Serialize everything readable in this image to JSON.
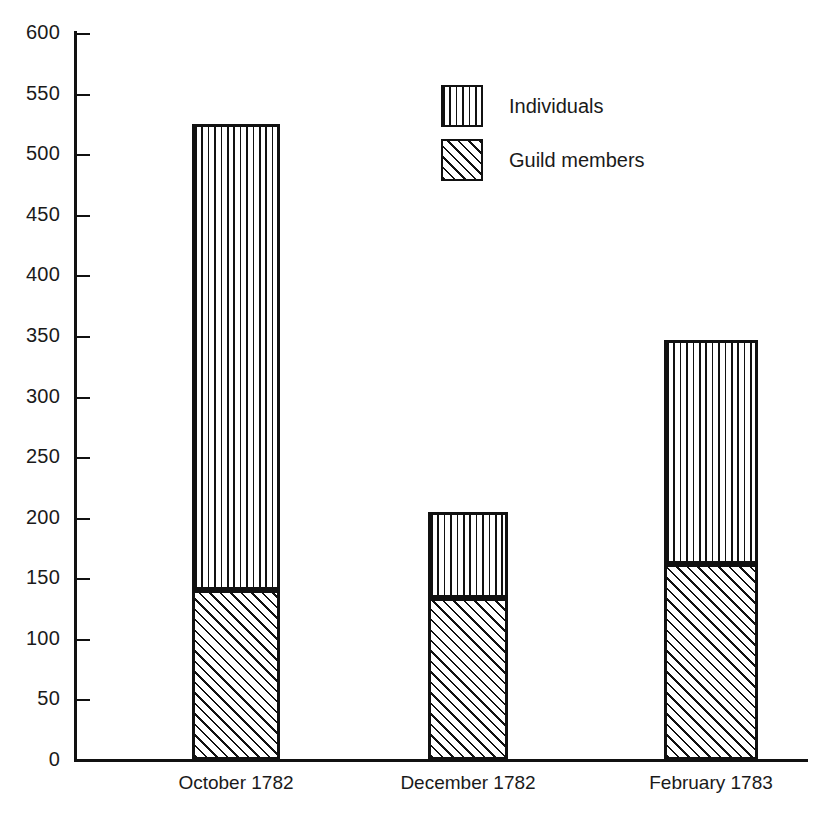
{
  "chart_data": {
    "type": "bar",
    "subtype": "stacked",
    "title": "",
    "subtitle": "",
    "xlabel": "",
    "ylabel": "",
    "categories": [
      "October 1782",
      "December 1782",
      "February 1783"
    ],
    "series": [
      {
        "name": "Guild members",
        "pattern": "diagonal-hatch",
        "values": [
          140,
          134,
          162
        ]
      },
      {
        "name": "Individuals",
        "pattern": "vertical-lines",
        "values": [
          385,
          71,
          185
        ]
      }
    ],
    "stack_totals": [
      525,
      205,
      347
    ],
    "ylim": [
      0,
      600
    ],
    "ytick_step": 50,
    "yticks": [
      0,
      50,
      100,
      150,
      200,
      250,
      300,
      350,
      400,
      450,
      500,
      550,
      600
    ],
    "ytick_labels": [
      "0",
      "50",
      "100",
      "150",
      "200",
      "250",
      "300",
      "350",
      "400",
      "450",
      "500",
      "550",
      "600"
    ],
    "grid": false,
    "legend_position": "upper-center",
    "legend_entries": [
      "Individuals",
      "Guild members"
    ],
    "colors": {
      "ink": "#111111",
      "background": "#ffffff"
    }
  },
  "legend": {
    "items": [
      {
        "label": "Individuals"
      },
      {
        "label": "Guild members"
      }
    ]
  },
  "axis": {
    "y_tick_labels": [
      "600",
      "550",
      "500",
      "450",
      "400",
      "350",
      "300",
      "250",
      "200",
      "150",
      "100",
      "50",
      "0"
    ],
    "x_category_labels": [
      "October 1782",
      "December 1782",
      "February 1783"
    ]
  }
}
